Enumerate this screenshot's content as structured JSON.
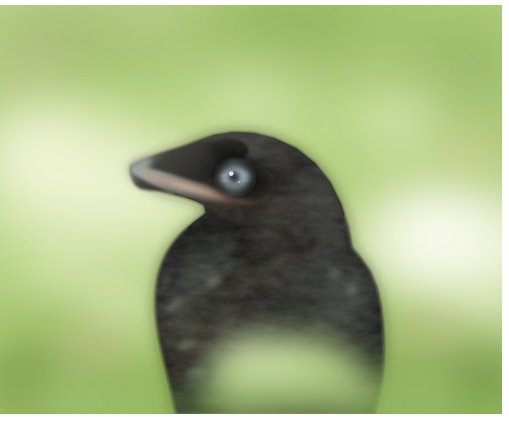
{
  "page": {
    "kind": "photograph",
    "width": 509,
    "height": 432
  },
  "photo": {
    "frame": {
      "x": 0,
      "y": 5,
      "width": 502,
      "height": 409
    },
    "margins": {
      "top": 5,
      "right": 7,
      "bottom": 18,
      "left": 0,
      "color": "#ffffff"
    },
    "background": {
      "description": "out-of-focus sunlit green vegetation with blown-out white highlights",
      "colors": {
        "green_mid": "#9ec46a",
        "green_light": "#c2dc94",
        "green_pale": "#dcebb8",
        "green_deep": "#7da84e",
        "highlight_white": "#fdfdf4",
        "highlight_cream": "#f3f3d8",
        "olive_shadow": "#a8a877",
        "khaki": "#c8bd8c"
      }
    },
    "foreground_foliage": {
      "description": "blurred green leaf mass crossing the lower centre of the frame",
      "colors": {
        "leaf_light": "#c6d99a",
        "leaf_mid": "#8fb45f",
        "leaf_dark": "#5d7f38"
      }
    },
    "bird": {
      "name": "juvenile crow",
      "plumage_colors": {
        "black": "#0e0d0c",
        "charcoal": "#24231f",
        "slate_sheen": "#3d423f",
        "feather_highlight": "#5e6258",
        "brown_wash": "#3a342b"
      },
      "beak": {
        "tip_color": "#8e948c",
        "upper_color": "#1d1c19",
        "gape_color": "#bb8f7d",
        "gape_pale": "#d9bda8",
        "tip_point": {
          "x": 130,
          "y": 161
        }
      },
      "eye": {
        "center": {
          "x": 235,
          "y": 172
        },
        "iris_color": "#aebfcb",
        "iris_inner_color": "#7f97a8",
        "pupil_color": "#14171a",
        "catchlight_color": "#e8eef2",
        "rim_color": "#2c2b28",
        "radius": 15
      },
      "outline_hint": "head top near y=128, nape right edge near x=355, breast base near y=410"
    }
  }
}
